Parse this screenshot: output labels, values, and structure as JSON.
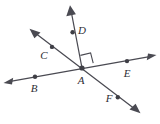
{
  "figure": {
    "background_color": "#ffffff",
    "line_color": "#4a4a52",
    "label_color": "#2e2e33",
    "dot_color": "#3f3f46",
    "vertex": {
      "name": "A",
      "label": "A",
      "x": 82,
      "y": 68,
      "label_x": 81,
      "label_y": 81
    },
    "points": [
      {
        "name": "B",
        "label": "B",
        "x": 35,
        "y": 77,
        "label_x": 34,
        "label_y": 89
      },
      {
        "name": "C",
        "label": "C",
        "x": 52,
        "y": 47,
        "label_x": 44,
        "label_y": 56
      },
      {
        "name": "D",
        "label": "D",
        "x": 73,
        "y": 32,
        "label_x": 82,
        "label_y": 31
      },
      {
        "name": "E",
        "label": "E",
        "x": 127,
        "y": 61,
        "label_x": 127,
        "label_y": 74
      },
      {
        "name": "F",
        "label": "F",
        "x": 118,
        "y": 97,
        "label_x": 109,
        "label_y": 99
      }
    ],
    "lines": [
      {
        "name": "line-BE",
        "through": [
          "B",
          "A",
          "E"
        ],
        "x1": 7,
        "y1": 82,
        "x2": 153,
        "y2": 56,
        "arrows": [
          "start",
          "end"
        ]
      },
      {
        "name": "line-CF",
        "through": [
          "C",
          "A",
          "F"
        ],
        "x1": 31,
        "y1": 30,
        "x2": 139,
        "y2": 112,
        "arrows": [
          "start",
          "end"
        ]
      },
      {
        "name": "ray-AD",
        "through": [
          "A",
          "D"
        ],
        "x1": 82,
        "y1": 68,
        "x2": 70,
        "y2": 6,
        "arrows": [
          "end"
        ]
      }
    ],
    "right_angle": {
      "name": "right-angle-DAE",
      "at": "A",
      "between": [
        "ray-AD",
        "ray-AE"
      ],
      "size": 11,
      "measure": "90"
    }
  }
}
